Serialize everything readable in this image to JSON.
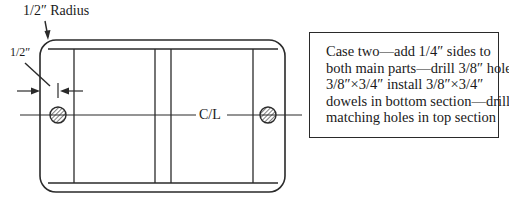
{
  "diagram": {
    "radius_label": "1/2″ Radius",
    "width_label": "1/2″",
    "centerline_label": "C/L",
    "note": {
      "lines": [
        "Case two—add 1/4″ sides to",
        "both main parts—drill 3/8″ holes",
        "3/8″×3/4″ install 3/8″×3/4″",
        "dowels in bottom section—drill",
        "matching holes in top section"
      ]
    },
    "colors": {
      "line": "#2a2a2a",
      "background": "#ffffff"
    }
  }
}
